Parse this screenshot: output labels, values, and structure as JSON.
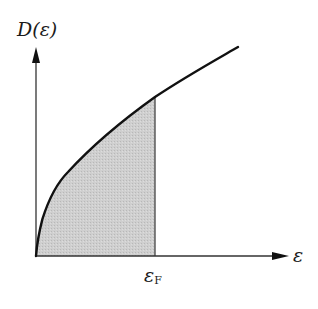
{
  "diagram": {
    "y_axis_label": "D(ε)",
    "x_axis_label": "ε",
    "fermi_label_base": "ε",
    "fermi_label_sub": "F",
    "curve": "D(ε) ∝ √ε",
    "shaded_region": "0 ≤ ε ≤ ε_F (occupied states)",
    "colors": {
      "curve": "#111111",
      "axes": "#333333",
      "fill": "#c8c8c8",
      "background": "#ffffff"
    }
  }
}
